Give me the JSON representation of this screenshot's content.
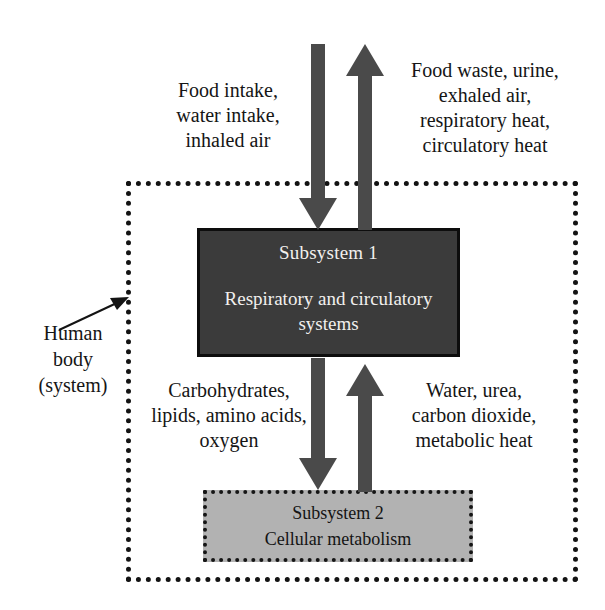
{
  "diagram": {
    "colors": {
      "subsystem1_fill": "#3b3b3b",
      "subsystem1_text": "#f2f0ee",
      "subsystem2_fill": "#b2b2b2",
      "subsystem2_text": "#141414",
      "arrow_fill": "#4a4a4a",
      "boundary_stroke": "#131313",
      "background": "#ffffff"
    },
    "system_boundary": {
      "name": "Human body (system)",
      "style": "dotted"
    },
    "subsystem1": {
      "title": "Subsystem 1",
      "body": "Respiratory and\ncirculatory systems"
    },
    "subsystem2": {
      "title": "Subsystem 2",
      "body": "Cellular metabolism"
    },
    "labels": {
      "human_body": "Human\nbody\n(system)",
      "inputs_top": "Food intake,\nwater intake,\ninhaled air",
      "outputs_top": "Food waste, urine,\nexhaled air,\nrespiratory heat,\ncirculatory heat",
      "inputs_bottom": "Carbohydrates,\nlipids, amino acids,\noxygen",
      "outputs_bottom": "Water, urea,\ncarbon dioxide,\nmetabolic heat"
    },
    "arrows": [
      {
        "name": "arrow-intake-down",
        "direction": "down",
        "from": "outside system",
        "to": "Subsystem 1",
        "carries": "Food intake, water intake, inhaled air"
      },
      {
        "name": "arrow-waste-up",
        "direction": "up",
        "from": "Subsystem 1",
        "to": "outside system",
        "carries": "Food waste, urine, exhaled air, respiratory heat, circulatory heat"
      },
      {
        "name": "arrow-nutrients-down",
        "direction": "down",
        "from": "Subsystem 1",
        "to": "Subsystem 2",
        "carries": "Carbohydrates, lipids, amino acids, oxygen"
      },
      {
        "name": "arrow-byproducts-up",
        "direction": "up",
        "from": "Subsystem 2",
        "to": "Subsystem 1",
        "carries": "Water, urea, carbon dioxide, metabolic heat"
      },
      {
        "name": "arrow-human-body-pointer",
        "direction": "up-right",
        "from": "Human body (system) label",
        "to": "system boundary",
        "carries": ""
      }
    ]
  }
}
